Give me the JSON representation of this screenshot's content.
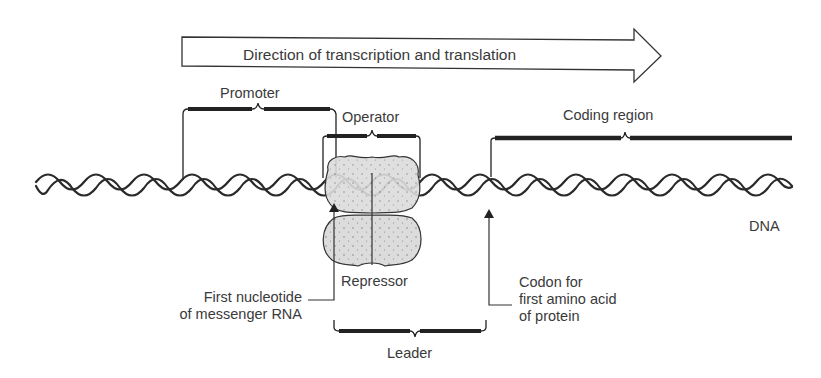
{
  "diagram": {
    "arrow_label": "Direction of transcription and translation",
    "labels": {
      "promoter": "Promoter",
      "operator": "Operator",
      "coding_region": "Coding region",
      "dna": "DNA",
      "repressor": "Repressor",
      "leader": "Leader"
    },
    "first_nucleotide": {
      "line1": "First nucleotide",
      "line2": "of messenger RNA"
    },
    "codon": {
      "line1": "Codon for",
      "line2": "first amino acid",
      "line3": "of protein"
    },
    "colors": {
      "line": "#2a2a2a",
      "repressor_fill": "#d9d9d9",
      "text": "#3a3a3a"
    }
  }
}
